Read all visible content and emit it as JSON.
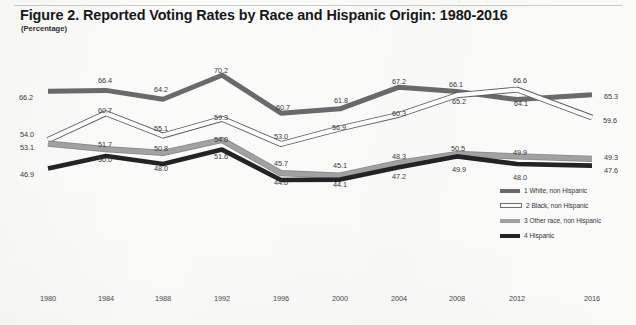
{
  "figure": {
    "title": "Figure 2. Reported Voting Rates by Race and Hispanic Origin: 1980-2016",
    "subtitle": "(Percentage)"
  },
  "legend": {
    "items": [
      {
        "label": "1 White, non Hispanic",
        "swatch": "white-line-swatch",
        "color": "#6a6a6c"
      },
      {
        "label": "2 Black, non Hispanic",
        "swatch": "black-line-swatch",
        "color": "#ffffff"
      },
      {
        "label": "3 Other race, non Hispanic",
        "swatch": "other-race-line-swatch",
        "color": "#a2a2a4"
      },
      {
        "label": "4 Hispanic",
        "swatch": "hispanic-line-swatch",
        "color": "#232325"
      }
    ]
  },
  "chart_data": {
    "type": "line",
    "title": "Figure 2. Reported Voting Rates by Race and Hispanic Origin: 1980-2016",
    "subtitle": "(Percentage)",
    "xlabel": "",
    "ylabel": "Percentage",
    "grid": false,
    "legend_position": "right-inside",
    "ylim": [
      40,
      72
    ],
    "categories": [
      "1980",
      "1984",
      "1988",
      "1992",
      "1996",
      "2000",
      "2004",
      "2008",
      "2012",
      "2016"
    ],
    "series": [
      {
        "name": "1 White, non Hispanic",
        "color": "#6a6a6c",
        "values": [
          66.2,
          66.4,
          64.2,
          70.2,
          60.7,
          61.8,
          67.2,
          66.1,
          64.1,
          65.3
        ]
      },
      {
        "name": "2 Black, non Hispanic",
        "color": "#ffffff",
        "values": [
          54.0,
          60.7,
          55.1,
          59.3,
          53.0,
          56.9,
          60.3,
          65.2,
          66.6,
          59.6
        ]
      },
      {
        "name": "3 Other race, non Hispanic",
        "color": "#a2a2a4",
        "values": [
          53.1,
          51.7,
          50.8,
          54.0,
          45.7,
          45.1,
          48.3,
          50.5,
          49.9,
          49.3
        ]
      },
      {
        "name": "4 Hispanic",
        "color": "#232325",
        "values": [
          46.9,
          50.0,
          48.0,
          51.6,
          44.0,
          44.1,
          47.2,
          49.9,
          48.0,
          47.6
        ]
      }
    ]
  },
  "point_labels": [
    {
      "text": "66.2",
      "x": 26,
      "y": 97
    },
    {
      "text": "66.4",
      "x": 105,
      "y": 80
    },
    {
      "text": "64.2",
      "x": 161,
      "y": 89
    },
    {
      "text": "70.2",
      "x": 221,
      "y": 70
    },
    {
      "text": "60.7",
      "x": 283,
      "y": 107
    },
    {
      "text": "61.8",
      "x": 341,
      "y": 100
    },
    {
      "text": "67.2",
      "x": 399,
      "y": 81
    },
    {
      "text": "66.1",
      "x": 456,
      "y": 84
    },
    {
      "text": "66.6",
      "x": 520,
      "y": 80
    },
    {
      "text": "65.3",
      "x": 611,
      "y": 96
    },
    {
      "text": "54.0",
      "x": 27,
      "y": 134
    },
    {
      "text": "60.7",
      "x": 105,
      "y": 110
    },
    {
      "text": "55.1",
      "x": 161,
      "y": 128
    },
    {
      "text": "59.3",
      "x": 221,
      "y": 117
    },
    {
      "text": "53.0",
      "x": 281,
      "y": 136
    },
    {
      "text": "56.9",
      "x": 339,
      "y": 127
    },
    {
      "text": "60.3",
      "x": 399,
      "y": 113
    },
    {
      "text": "65.2",
      "x": 459,
      "y": 101
    },
    {
      "text": "64.1",
      "x": 521,
      "y": 103
    },
    {
      "text": "59.6",
      "x": 610,
      "y": 120
    },
    {
      "text": "53.1",
      "x": 27,
      "y": 147
    },
    {
      "text": "51.7",
      "x": 105,
      "y": 144
    },
    {
      "text": "50.8",
      "x": 161,
      "y": 148
    },
    {
      "text": "54.0",
      "x": 221,
      "y": 139
    },
    {
      "text": "45.7",
      "x": 281,
      "y": 163
    },
    {
      "text": "45.1",
      "x": 340,
      "y": 165
    },
    {
      "text": "48.3",
      "x": 399,
      "y": 156
    },
    {
      "text": "50.5",
      "x": 458,
      "y": 148
    },
    {
      "text": "49.9",
      "x": 520,
      "y": 152
    },
    {
      "text": "49.3",
      "x": 611,
      "y": 157
    },
    {
      "text": "46.9",
      "x": 27,
      "y": 174
    },
    {
      "text": "50.0",
      "x": 105,
      "y": 159
    },
    {
      "text": "48.0",
      "x": 161,
      "y": 168
    },
    {
      "text": "51.6",
      "x": 221,
      "y": 156
    },
    {
      "text": "44.0",
      "x": 281,
      "y": 182
    },
    {
      "text": "44.1",
      "x": 340,
      "y": 184
    },
    {
      "text": "47.2",
      "x": 399,
      "y": 176
    },
    {
      "text": "49.9",
      "x": 459,
      "y": 169
    },
    {
      "text": "48.0",
      "x": 520,
      "y": 177
    },
    {
      "text": "47.6",
      "x": 611,
      "y": 170
    }
  ],
  "x_axis": {
    "ticks": [
      {
        "label": "1980",
        "x": 48
      },
      {
        "label": "1984",
        "x": 106
      },
      {
        "label": "1988",
        "x": 163
      },
      {
        "label": "1992",
        "x": 222
      },
      {
        "label": "1996",
        "x": 281
      },
      {
        "label": "2000",
        "x": 340
      },
      {
        "label": "2004",
        "x": 399
      },
      {
        "label": "2008",
        "x": 457
      },
      {
        "label": "2012",
        "x": 517
      },
      {
        "label": "2016",
        "x": 592
      }
    ],
    "y": 294
  }
}
